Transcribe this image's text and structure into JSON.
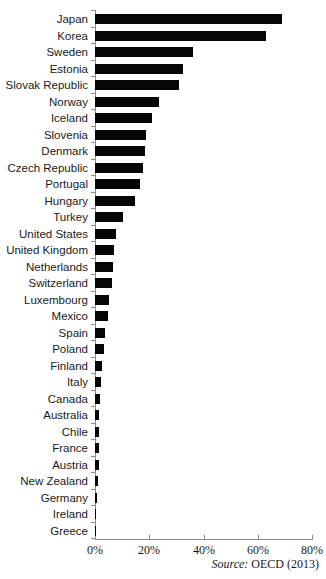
{
  "chart_data": {
    "type": "bar",
    "orientation": "horizontal",
    "title": "",
    "xlabel": "",
    "ylabel": "",
    "xlim": [
      0,
      80
    ],
    "x_ticks": [
      "0%",
      "20%",
      "40%",
      "60%",
      "80%"
    ],
    "x_tick_values": [
      0,
      20,
      40,
      60,
      80
    ],
    "grid": false,
    "legend": "none",
    "bar_color": "#050505",
    "axis_color": "#8c8c8c",
    "categories": [
      "Japan",
      "Korea",
      "Sweden",
      "Estonia",
      "Slovak Republic",
      "Norway",
      "Iceland",
      "Slovenia",
      "Denmark",
      "Czech Republic",
      "Portugal",
      "Hungary",
      "Turkey",
      "United States",
      "United Kingdom",
      "Netherlands",
      "Switzerland",
      "Luxembourg",
      "Mexico",
      "Spain",
      "Poland",
      "Finland",
      "Italy",
      "Canada",
      "Australia",
      "Chile",
      "France",
      "Austria",
      "New Zealand",
      "Germany",
      "Ireland",
      "Greece"
    ],
    "values": [
      69,
      63,
      36,
      32.6,
      31,
      23.7,
      21,
      18.7,
      18.3,
      17.6,
      16.6,
      14.8,
      10.5,
      7.7,
      7.0,
      6.6,
      6.4,
      5.1,
      4.8,
      3.8,
      3.4,
      2.7,
      2.1,
      1.8,
      1.6,
      1.5,
      1.4,
      1.3,
      1.0,
      0.8,
      0.3,
      0.1
    ],
    "source_note": "Source: OECD (2013)"
  },
  "source": {
    "label": "Source:",
    "text": "OECD (2013)"
  }
}
